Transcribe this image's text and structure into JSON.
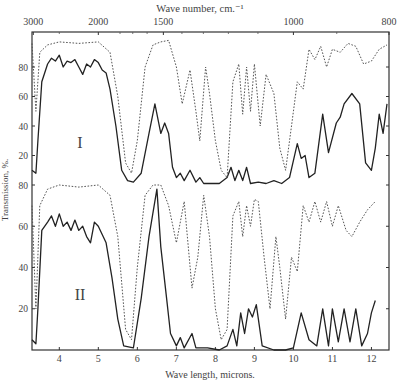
{
  "chart_data": {
    "type": "line",
    "title": "",
    "top_axis": {
      "label": "Wave number, cm.⁻¹",
      "ticks": [
        {
          "label": "3000",
          "micron": 3.333
        },
        {
          "label": "2000",
          "micron": 5.0
        },
        {
          "label": "1500",
          "micron": 6.667
        },
        {
          "label": "1000",
          "micron": 10.0
        },
        {
          "label": "800",
          "micron": 12.5
        }
      ]
    },
    "xlabel": "Wave length, microns.",
    "ylabel": "Transmission, %.",
    "xlim": [
      3.3,
      12.45
    ],
    "x_ticks": [
      4,
      5,
      6,
      7,
      8,
      9,
      10,
      11,
      12
    ],
    "grid": false,
    "legend": null,
    "panels": [
      {
        "name": "I",
        "y_ticks": [
          20,
          40,
          60,
          80
        ],
        "ylim": [
          0,
          100
        ],
        "series": [
          {
            "name": "solid",
            "style": "solid",
            "points": [
              [
                3.3,
                10
              ],
              [
                3.4,
                8
              ],
              [
                3.45,
                30
              ],
              [
                3.55,
                70
              ],
              [
                3.7,
                82
              ],
              [
                3.8,
                86
              ],
              [
                3.9,
                84
              ],
              [
                4.0,
                88
              ],
              [
                4.1,
                80
              ],
              [
                4.2,
                84
              ],
              [
                4.3,
                83
              ],
              [
                4.4,
                85
              ],
              [
                4.5,
                80
              ],
              [
                4.6,
                75
              ],
              [
                4.7,
                82
              ],
              [
                4.8,
                80
              ],
              [
                4.9,
                85
              ],
              [
                5.0,
                83
              ],
              [
                5.1,
                78
              ],
              [
                5.2,
                76
              ],
              [
                5.3,
                65
              ],
              [
                5.45,
                40
              ],
              [
                5.6,
                10
              ],
              [
                5.75,
                3
              ],
              [
                5.9,
                2
              ],
              [
                6.1,
                8
              ],
              [
                6.3,
                35
              ],
              [
                6.45,
                55
              ],
              [
                6.6,
                35
              ],
              [
                6.7,
                42
              ],
              [
                6.8,
                35
              ],
              [
                6.9,
                12
              ],
              [
                7.0,
                5
              ],
              [
                7.1,
                8
              ],
              [
                7.2,
                3
              ],
              [
                7.35,
                10
              ],
              [
                7.5,
                2
              ],
              [
                7.6,
                5
              ],
              [
                7.7,
                1
              ],
              [
                7.9,
                1
              ],
              [
                8.1,
                1
              ],
              [
                8.3,
                5
              ],
              [
                8.4,
                12
              ],
              [
                8.5,
                3
              ],
              [
                8.6,
                10
              ],
              [
                8.7,
                3
              ],
              [
                8.8,
                12
              ],
              [
                8.9,
                1
              ],
              [
                9.1,
                2
              ],
              [
                9.3,
                1
              ],
              [
                9.5,
                3
              ],
              [
                9.7,
                1
              ],
              [
                9.9,
                5
              ],
              [
                10.1,
                28
              ],
              [
                10.2,
                18
              ],
              [
                10.3,
                20
              ],
              [
                10.4,
                5
              ],
              [
                10.55,
                8
              ],
              [
                10.75,
                48
              ],
              [
                10.9,
                22
              ],
              [
                11.1,
                42
              ],
              [
                11.2,
                46
              ],
              [
                11.3,
                55
              ],
              [
                11.5,
                62
              ],
              [
                11.7,
                55
              ],
              [
                11.85,
                15
              ],
              [
                12.0,
                10
              ],
              [
                12.1,
                25
              ],
              [
                12.2,
                48
              ],
              [
                12.3,
                35
              ],
              [
                12.4,
                55
              ]
            ]
          },
          {
            "name": "dotted",
            "style": "dotted",
            "points": [
              [
                3.3,
                96
              ],
              [
                3.4,
                50
              ],
              [
                3.5,
                90
              ],
              [
                3.7,
                95
              ],
              [
                4.0,
                97
              ],
              [
                4.5,
                96
              ],
              [
                5.0,
                97
              ],
              [
                5.3,
                90
              ],
              [
                5.5,
                60
              ],
              [
                5.7,
                15
              ],
              [
                5.85,
                8
              ],
              [
                6.0,
                30
              ],
              [
                6.2,
                80
              ],
              [
                6.4,
                95
              ],
              [
                6.6,
                97
              ],
              [
                6.8,
                98
              ],
              [
                7.0,
                80
              ],
              [
                7.15,
                55
              ],
              [
                7.35,
                78
              ],
              [
                7.5,
                50
              ],
              [
                7.6,
                30
              ],
              [
                7.75,
                80
              ],
              [
                7.85,
                62
              ],
              [
                8.0,
                30
              ],
              [
                8.15,
                10
              ],
              [
                8.3,
                5
              ],
              [
                8.45,
                70
              ],
              [
                8.6,
                82
              ],
              [
                8.7,
                48
              ],
              [
                8.8,
                80
              ],
              [
                8.9,
                50
              ],
              [
                9.0,
                82
              ],
              [
                9.15,
                40
              ],
              [
                9.3,
                75
              ],
              [
                9.5,
                62
              ],
              [
                9.65,
                25
              ],
              [
                9.8,
                10
              ],
              [
                9.95,
                40
              ],
              [
                10.1,
                70
              ],
              [
                10.25,
                65
              ],
              [
                10.4,
                92
              ],
              [
                10.55,
                85
              ],
              [
                10.7,
                94
              ],
              [
                10.85,
                80
              ],
              [
                11.0,
                92
              ],
              [
                11.2,
                90
              ],
              [
                11.4,
                96
              ],
              [
                11.6,
                94
              ],
              [
                11.8,
                82
              ],
              [
                12.0,
                84
              ],
              [
                12.2,
                92
              ],
              [
                12.4,
                95
              ]
            ]
          }
        ]
      },
      {
        "name": "II",
        "y_ticks": [
          20,
          40,
          60,
          80
        ],
        "ylim": [
          0,
          100
        ],
        "series": [
          {
            "name": "solid",
            "style": "solid",
            "points": [
              [
                3.3,
                5
              ],
              [
                3.4,
                3
              ],
              [
                3.45,
                20
              ],
              [
                3.55,
                58
              ],
              [
                3.7,
                62
              ],
              [
                3.8,
                65
              ],
              [
                3.9,
                60
              ],
              [
                4.0,
                66
              ],
              [
                4.1,
                60
              ],
              [
                4.2,
                62
              ],
              [
                4.3,
                58
              ],
              [
                4.4,
                63
              ],
              [
                4.5,
                58
              ],
              [
                4.6,
                60
              ],
              [
                4.7,
                55
              ],
              [
                4.8,
                52
              ],
              [
                4.9,
                62
              ],
              [
                5.0,
                60
              ],
              [
                5.1,
                56
              ],
              [
                5.2,
                52
              ],
              [
                5.35,
                35
              ],
              [
                5.5,
                15
              ],
              [
                5.65,
                2
              ],
              [
                5.9,
                1
              ],
              [
                6.1,
                25
              ],
              [
                6.3,
                55
              ],
              [
                6.5,
                78
              ],
              [
                6.6,
                50
              ],
              [
                6.75,
                25
              ],
              [
                6.85,
                8
              ],
              [
                7.0,
                2
              ],
              [
                7.1,
                6
              ],
              [
                7.2,
                1
              ],
              [
                7.4,
                8
              ],
              [
                7.5,
                1
              ],
              [
                7.8,
                1
              ],
              [
                8.1,
                0
              ],
              [
                8.3,
                2
              ],
              [
                8.45,
                10
              ],
              [
                8.55,
                2
              ],
              [
                8.65,
                18
              ],
              [
                8.75,
                8
              ],
              [
                8.85,
                20
              ],
              [
                8.95,
                16
              ],
              [
                9.05,
                22
              ],
              [
                9.2,
                2
              ],
              [
                9.5,
                0
              ],
              [
                9.8,
                0
              ],
              [
                10.0,
                1
              ],
              [
                10.2,
                18
              ],
              [
                10.4,
                5
              ],
              [
                10.6,
                2
              ],
              [
                10.75,
                20
              ],
              [
                10.9,
                2
              ],
              [
                11.0,
                20
              ],
              [
                11.15,
                4
              ],
              [
                11.3,
                20
              ],
              [
                11.45,
                4
              ],
              [
                11.6,
                20
              ],
              [
                11.75,
                2
              ],
              [
                11.9,
                8
              ],
              [
                12.0,
                18
              ],
              [
                12.1,
                24
              ]
            ]
          },
          {
            "name": "dotted",
            "style": "dotted",
            "points": [
              [
                3.3,
                70
              ],
              [
                3.4,
                20
              ],
              [
                3.5,
                70
              ],
              [
                3.7,
                78
              ],
              [
                4.0,
                80
              ],
              [
                4.5,
                79
              ],
              [
                5.0,
                80
              ],
              [
                5.3,
                75
              ],
              [
                5.5,
                55
              ],
              [
                5.7,
                10
              ],
              [
                5.85,
                5
              ],
              [
                6.0,
                40
              ],
              [
                6.2,
                75
              ],
              [
                6.4,
                80
              ],
              [
                6.6,
                80
              ],
              [
                6.8,
                70
              ],
              [
                7.0,
                52
              ],
              [
                7.2,
                72
              ],
              [
                7.4,
                30
              ],
              [
                7.55,
                45
              ],
              [
                7.7,
                75
              ],
              [
                7.85,
                55
              ],
              [
                8.0,
                20
              ],
              [
                8.15,
                5
              ],
              [
                8.3,
                10
              ],
              [
                8.45,
                65
              ],
              [
                8.6,
                72
              ],
              [
                8.7,
                55
              ],
              [
                8.8,
                70
              ],
              [
                8.9,
                60
              ],
              [
                9.0,
                73
              ],
              [
                9.1,
                72
              ],
              [
                9.25,
                45
              ],
              [
                9.4,
                20
              ],
              [
                9.55,
                55
              ],
              [
                9.65,
                40
              ],
              [
                9.8,
                15
              ],
              [
                9.95,
                45
              ],
              [
                10.1,
                38
              ],
              [
                10.25,
                70
              ],
              [
                10.4,
                62
              ],
              [
                10.55,
                72
              ],
              [
                10.7,
                62
              ],
              [
                10.85,
                72
              ],
              [
                11.0,
                60
              ],
              [
                11.15,
                70
              ],
              [
                11.35,
                58
              ],
              [
                11.5,
                55
              ],
              [
                11.7,
                62
              ],
              [
                11.9,
                68
              ],
              [
                12.1,
                72
              ]
            ]
          }
        ]
      }
    ]
  },
  "labels": {
    "panel_I": "I",
    "panel_II": "II",
    "top_axis_title": "Wave number, cm.⁻¹",
    "xlabel": "Wave length, microns.",
    "ylabel": "Transmission, %."
  }
}
